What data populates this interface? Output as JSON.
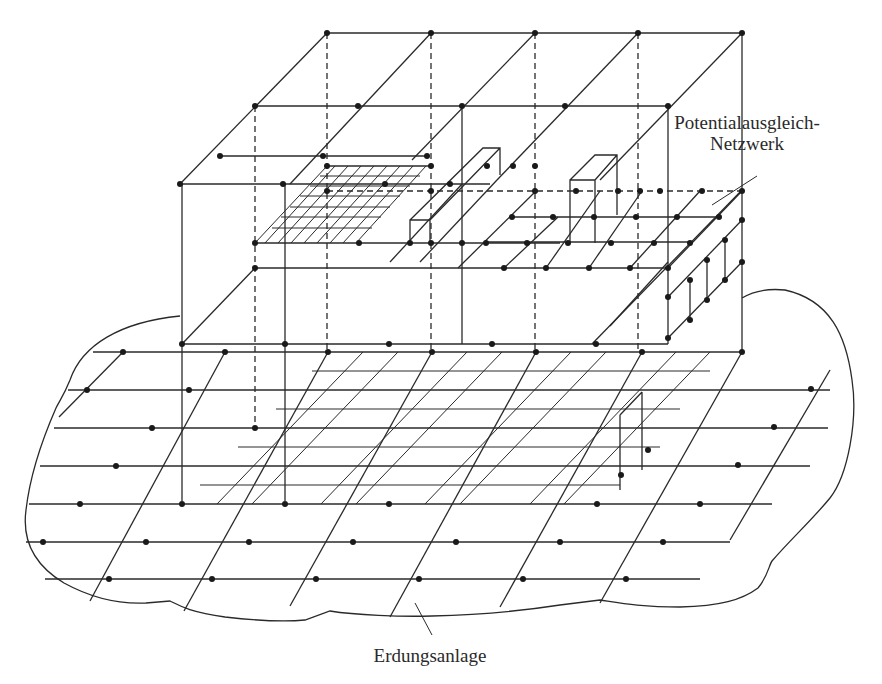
{
  "figure": {
    "type": "isometric technical diagram",
    "colors": {
      "line": "#2a2a2a",
      "background": "#ffffff"
    }
  },
  "labels": {
    "network_line1": "Potentialausgleich-",
    "network_line2": "Netzwerk",
    "earthing": "Erdungsanlage"
  },
  "components": [
    {
      "name": "roof-mesh",
      "description": "top mesh grid with connection nodes"
    },
    {
      "name": "floor-mesh",
      "description": "intermediate floor meshes with fine grid on left"
    },
    {
      "name": "building-columns",
      "description": "vertical conductors (solid front, dashed hidden)"
    },
    {
      "name": "ground-grid",
      "description": "earthing grid mesh within irregular earth outline"
    },
    {
      "name": "foundation-mesh",
      "description": "dense mesh under building footprint"
    }
  ]
}
